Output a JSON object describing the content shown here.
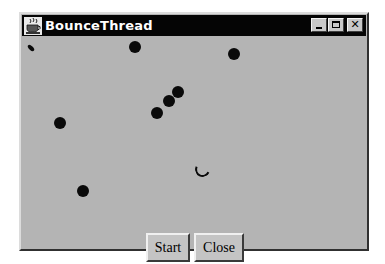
{
  "window": {
    "title": "BounceThread",
    "icon": "java-coffee-cup-icon",
    "controls": {
      "minimize": "minimize-icon",
      "maximize": "maximize-icon",
      "close": "close-icon",
      "close_glyph": "✕"
    }
  },
  "canvas": {
    "background": "#b4b4b4",
    "ball_color": "#0a0a0a",
    "balls": [
      {
        "x": 31,
        "y": 48,
        "r": 4,
        "shape": "sliver"
      },
      {
        "x": 135,
        "y": 47,
        "r": 6,
        "shape": "full"
      },
      {
        "x": 234,
        "y": 54,
        "r": 6,
        "shape": "full"
      },
      {
        "x": 178,
        "y": 92,
        "r": 6,
        "shape": "full"
      },
      {
        "x": 169,
        "y": 101,
        "r": 6,
        "shape": "full"
      },
      {
        "x": 157,
        "y": 113,
        "r": 6,
        "shape": "full"
      },
      {
        "x": 60,
        "y": 123,
        "r": 6,
        "shape": "full"
      },
      {
        "x": 200,
        "y": 167,
        "r": 6,
        "shape": "partial"
      },
      {
        "x": 83,
        "y": 191,
        "r": 6,
        "shape": "full"
      }
    ]
  },
  "buttons": {
    "start_label": "Start",
    "close_label": "Close"
  }
}
